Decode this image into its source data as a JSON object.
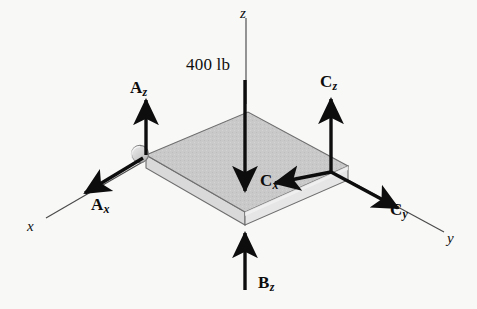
{
  "figure": {
    "background_color": "#f8f8f7",
    "ink_color": "#0d0d0d",
    "plate": {
      "top_face_color": "#c9c9c9",
      "side_face_color": "#e2e2e2",
      "front_face_color": "#d4d4d4",
      "edge_color": "#6e6e6e"
    },
    "support": {
      "name": "ball-and-socket-support",
      "fill_color": "#cfcfcf"
    }
  },
  "axes": [
    {
      "id": "x",
      "label": "x"
    },
    {
      "id": "y",
      "label": "y"
    },
    {
      "id": "z",
      "label": "z"
    }
  ],
  "load": {
    "label": "400 lb",
    "direction": "down"
  },
  "reactions": [
    {
      "id": "Az",
      "symbol": "A",
      "subscript": "z",
      "direction": "up",
      "point": "A"
    },
    {
      "id": "Ax",
      "symbol": "A",
      "subscript": "x",
      "direction": "down-left",
      "point": "A"
    },
    {
      "id": "Bz",
      "symbol": "B",
      "subscript": "z",
      "direction": "up",
      "point": "B"
    },
    {
      "id": "Cz",
      "symbol": "C",
      "subscript": "z",
      "direction": "up",
      "point": "C"
    },
    {
      "id": "Cx",
      "symbol": "C",
      "subscript": "x",
      "direction": "down-left",
      "point": "C"
    },
    {
      "id": "Cy",
      "symbol": "C",
      "subscript": "y",
      "direction": "down-right",
      "point": "C"
    }
  ]
}
